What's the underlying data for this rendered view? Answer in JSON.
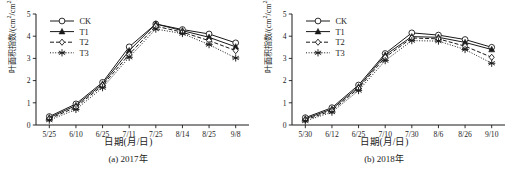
{
  "figure": {
    "panels": [
      {
        "caption": "(a) 2017年",
        "xlabel": "日期(月/日)",
        "ylabel_main": "叶面积指数/(cm",
        "ylabel_sup1": "2",
        "ylabel_mid": "/cm",
        "ylabel_sup2": "2",
        "ylabel_end": ")"
      },
      {
        "caption": "(b) 2018年",
        "xlabel": "日期(月/日)",
        "ylabel_main": "叶面积指数/(cm",
        "ylabel_sup1": "2",
        "ylabel_mid": "/cm",
        "ylabel_sup2": "2",
        "ylabel_end": ")"
      }
    ]
  },
  "chart_data": [
    {
      "type": "line",
      "title": "(a) 2017年",
      "xlabel": "日期(月/日)",
      "ylabel": "叶面积指数/(cm2/cm2)",
      "categories": [
        "5/25",
        "6/10",
        "6/25",
        "7/11",
        "7/25",
        "8/14",
        "8/25",
        "9/8"
      ],
      "ylim": [
        0,
        5
      ],
      "yticks": [
        0,
        1,
        2,
        3,
        4,
        5
      ],
      "grid": false,
      "legend_position": "top-left",
      "series": [
        {
          "name": "CK",
          "marker": "open-circle",
          "line": "solid",
          "values": [
            0.38,
            0.95,
            1.92,
            3.52,
            4.55,
            4.3,
            4.1,
            3.7
          ]
        },
        {
          "name": "T1",
          "marker": "filled-triangle",
          "line": "solid",
          "values": [
            0.33,
            0.88,
            1.85,
            3.35,
            4.55,
            4.25,
            3.95,
            3.52
          ]
        },
        {
          "name": "T2",
          "marker": "open-diamond",
          "line": "dashed",
          "values": [
            0.28,
            0.8,
            1.78,
            3.18,
            4.45,
            4.18,
            3.8,
            3.35
          ]
        },
        {
          "name": "T3",
          "marker": "asterisk",
          "line": "dotted",
          "values": [
            0.22,
            0.7,
            1.68,
            3.05,
            4.32,
            4.12,
            3.62,
            3.02
          ]
        }
      ]
    },
    {
      "type": "line",
      "title": "(b) 2018年",
      "xlabel": "日期(月/日)",
      "ylabel": "叶面积指数/(cm2/cm2)",
      "categories": [
        "5/30",
        "6/12",
        "6/25",
        "7/10",
        "7/30",
        "8/6",
        "8/26",
        "9/10"
      ],
      "ylim": [
        0,
        5
      ],
      "yticks": [
        0,
        1,
        2,
        3,
        4,
        5
      ],
      "grid": false,
      "legend_position": "top-left",
      "series": [
        {
          "name": "CK",
          "marker": "open-circle",
          "line": "solid",
          "values": [
            0.33,
            0.78,
            1.8,
            3.22,
            4.15,
            4.05,
            3.85,
            3.5
          ]
        },
        {
          "name": "T1",
          "marker": "filled-triangle",
          "line": "solid",
          "values": [
            0.28,
            0.72,
            1.72,
            3.15,
            3.98,
            3.95,
            3.72,
            3.4
          ]
        },
        {
          "name": "T2",
          "marker": "open-diamond",
          "line": "dashed",
          "values": [
            0.23,
            0.65,
            1.65,
            3.05,
            3.92,
            3.88,
            3.55,
            3.05
          ]
        },
        {
          "name": "T3",
          "marker": "asterisk",
          "line": "dotted",
          "values": [
            0.18,
            0.58,
            1.55,
            2.9,
            3.8,
            3.78,
            3.4,
            2.78
          ]
        }
      ]
    }
  ],
  "legend": {
    "entries": [
      {
        "label": "CK",
        "marker": "open-circle",
        "line": "solid"
      },
      {
        "label": "T1",
        "marker": "filled-triangle",
        "line": "solid"
      },
      {
        "label": "T2",
        "marker": "open-diamond",
        "line": "dashed"
      },
      {
        "label": "T3",
        "marker": "asterisk",
        "line": "dotted"
      }
    ]
  },
  "colors": {
    "line": "#1a1a1a",
    "background": "#ffffff",
    "marker_fill": "#ffffff"
  }
}
